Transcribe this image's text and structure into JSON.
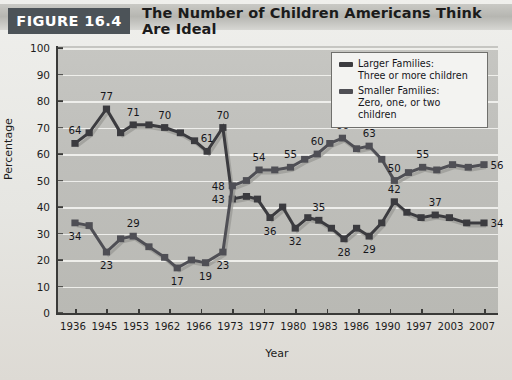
{
  "figure": {
    "tag": "FIGURE 16.4",
    "title": "The Number of Children Americans Think Are Ideal"
  },
  "legend": {
    "position": "top-right",
    "items": [
      {
        "swatch": "legend-swatch-larger",
        "line1": "Larger Families:",
        "line2": "Three or more children",
        "color": "#3b3b3f"
      },
      {
        "swatch": "legend-swatch-smaller",
        "line1": "Smaller Families:",
        "line2": "Zero, one, or two children",
        "color": "#4f4f55"
      }
    ]
  },
  "chart_data": {
    "type": "line",
    "title": "The Number of Children Americans Think Are Ideal",
    "xlabel": "Year",
    "ylabel": "Percentage",
    "ylim": [
      0,
      100
    ],
    "yticks": [
      0,
      10,
      20,
      30,
      40,
      50,
      60,
      70,
      80,
      90,
      100
    ],
    "grid": true,
    "x": [
      "1936",
      "1945",
      "1953",
      "1962",
      "1966",
      "1973",
      "1977",
      "1980",
      "1983",
      "1986",
      "1990",
      "1997",
      "2003",
      "2007"
    ],
    "xticks": [
      "1936",
      "1945",
      "1953",
      "1962",
      "1966",
      "1973",
      "1977",
      "1980",
      "1983",
      "1986",
      "1990",
      "1997",
      "2003",
      "2007"
    ],
    "series": [
      {
        "name": "Larger Families: Three or more children",
        "color": "#3b3b3f",
        "points": [
          {
            "x": 0.0,
            "y": 64,
            "label": "64"
          },
          {
            "x": 0.45,
            "y": 68,
            "label": ""
          },
          {
            "x": 1.0,
            "y": 77,
            "label": "77"
          },
          {
            "x": 1.45,
            "y": 68,
            "label": ""
          },
          {
            "x": 1.85,
            "y": 71,
            "label": "71"
          },
          {
            "x": 2.35,
            "y": 71,
            "label": ""
          },
          {
            "x": 2.85,
            "y": 70,
            "label": "70"
          },
          {
            "x": 3.35,
            "y": 68,
            "label": ""
          },
          {
            "x": 3.8,
            "y": 65,
            "label": ""
          },
          {
            "x": 4.2,
            "y": 61,
            "label": "61"
          },
          {
            "x": 4.7,
            "y": 70,
            "label": "70"
          },
          {
            "x": 5.0,
            "y": 43,
            "label": "43"
          },
          {
            "x": 5.45,
            "y": 44,
            "label": ""
          },
          {
            "x": 5.8,
            "y": 43,
            "label": ""
          },
          {
            "x": 6.2,
            "y": 36,
            "label": "36"
          },
          {
            "x": 6.6,
            "y": 40,
            "label": ""
          },
          {
            "x": 7.0,
            "y": 32,
            "label": "32"
          },
          {
            "x": 7.4,
            "y": 36,
            "label": ""
          },
          {
            "x": 7.75,
            "y": 35,
            "label": "35"
          },
          {
            "x": 8.15,
            "y": 32,
            "label": ""
          },
          {
            "x": 8.55,
            "y": 28,
            "label": "28"
          },
          {
            "x": 8.95,
            "y": 32,
            "label": ""
          },
          {
            "x": 9.35,
            "y": 29,
            "label": "29"
          },
          {
            "x": 9.75,
            "y": 34,
            "label": ""
          },
          {
            "x": 10.15,
            "y": 42,
            "label": "42"
          },
          {
            "x": 10.55,
            "y": 38,
            "label": ""
          },
          {
            "x": 11.0,
            "y": 36,
            "label": ""
          },
          {
            "x": 11.45,
            "y": 37,
            "label": "37"
          },
          {
            "x": 11.9,
            "y": 36,
            "label": ""
          },
          {
            "x": 12.45,
            "y": 34,
            "label": ""
          },
          {
            "x": 13.0,
            "y": 34,
            "label": "34"
          }
        ]
      },
      {
        "name": "Smaller Families: Zero, one, or two children",
        "color": "#4f4f55",
        "points": [
          {
            "x": 0.0,
            "y": 34,
            "label": "34"
          },
          {
            "x": 0.45,
            "y": 33,
            "label": ""
          },
          {
            "x": 1.0,
            "y": 23,
            "label": "23"
          },
          {
            "x": 1.45,
            "y": 28,
            "label": ""
          },
          {
            "x": 1.85,
            "y": 29,
            "label": "29"
          },
          {
            "x": 2.35,
            "y": 25,
            "label": ""
          },
          {
            "x": 2.85,
            "y": 21,
            "label": ""
          },
          {
            "x": 3.25,
            "y": 17,
            "label": "17"
          },
          {
            "x": 3.7,
            "y": 20,
            "label": ""
          },
          {
            "x": 4.15,
            "y": 19,
            "label": "19"
          },
          {
            "x": 4.7,
            "y": 23,
            "label": "23"
          },
          {
            "x": 5.0,
            "y": 48,
            "label": "48"
          },
          {
            "x": 5.45,
            "y": 50,
            "label": ""
          },
          {
            "x": 5.85,
            "y": 54,
            "label": "54"
          },
          {
            "x": 6.35,
            "y": 54,
            "label": ""
          },
          {
            "x": 6.85,
            "y": 55,
            "label": "55"
          },
          {
            "x": 7.3,
            "y": 58,
            "label": ""
          },
          {
            "x": 7.7,
            "y": 60,
            "label": "60"
          },
          {
            "x": 8.1,
            "y": 64,
            "label": ""
          },
          {
            "x": 8.5,
            "y": 66,
            "label": "66"
          },
          {
            "x": 8.95,
            "y": 62,
            "label": ""
          },
          {
            "x": 9.35,
            "y": 63,
            "label": "63"
          },
          {
            "x": 9.75,
            "y": 58,
            "label": ""
          },
          {
            "x": 10.15,
            "y": 50,
            "label": "50"
          },
          {
            "x": 10.6,
            "y": 53,
            "label": ""
          },
          {
            "x": 11.05,
            "y": 55,
            "label": "55"
          },
          {
            "x": 11.5,
            "y": 54,
            "label": ""
          },
          {
            "x": 12.0,
            "y": 56,
            "label": ""
          },
          {
            "x": 12.5,
            "y": 55,
            "label": ""
          },
          {
            "x": 13.0,
            "y": 56,
            "label": "56"
          }
        ]
      }
    ]
  }
}
